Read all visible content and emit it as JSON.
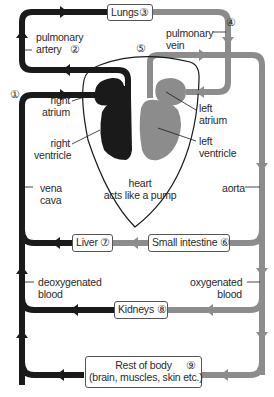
{
  "colors": {
    "deoxygenated": "#1a1a1a",
    "oxygenated": "#8c8c8c",
    "background": "#ffffff"
  },
  "organs": {
    "lungs": {
      "label": "Lungs",
      "number": "③"
    },
    "small_intestine": {
      "label": "Small intestine",
      "number": "⑥"
    },
    "liver": {
      "label": "Liver",
      "number": "⑦"
    },
    "kidneys": {
      "label": "Kidneys",
      "number": "⑧"
    },
    "rest_of_body": {
      "line1": "Rest of body",
      "line2": "(brain, muscles, skin etc.)",
      "number": "⑨"
    }
  },
  "vessels": {
    "pulmonary_artery": {
      "line1": "pulmonary",
      "line2": "artery",
      "number": "②"
    },
    "pulmonary_vein": {
      "line1": "pulmonary",
      "line2": "vein",
      "number": "④"
    },
    "vena_cava": {
      "line1": "vena",
      "line2": "cava",
      "number": "①"
    },
    "aorta": {
      "label": "aorta",
      "number": "⑤"
    }
  },
  "heart": {
    "right_atrium": {
      "line1": "right",
      "line2": "atrium"
    },
    "right_ventricle": {
      "line1": "right",
      "line2": "ventricle"
    },
    "left_atrium": {
      "line1": "left",
      "line2": "atrium"
    },
    "left_ventricle": {
      "line1": "left",
      "line2": "ventricle"
    },
    "caption_line1": "heart",
    "caption_line2": "acts like a pump"
  },
  "blood": {
    "deoxygenated": {
      "line1": "deoxygenated",
      "line2": "blood"
    },
    "oxygenated": {
      "line1": "oxygenated",
      "line2": "blood"
    }
  }
}
